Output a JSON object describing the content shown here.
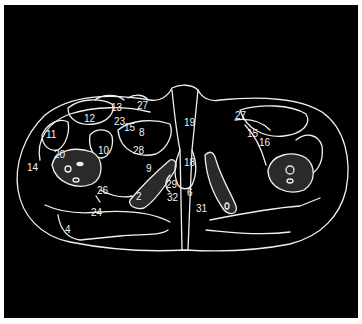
{
  "figure": {
    "type": "axial cross-section line drawing",
    "background": "#000000",
    "line_color": "#f0f0f0",
    "labels": [
      {
        "text": "13",
        "x": 111,
        "y": 103
      },
      {
        "text": "27",
        "x": 137,
        "y": 101
      },
      {
        "text": "12",
        "x": 84,
        "y": 114
      },
      {
        "text": "23",
        "x": 114,
        "y": 117
      },
      {
        "text": "15",
        "x": 124,
        "y": 123
      },
      {
        "text": "8",
        "x": 139,
        "y": 128
      },
      {
        "text": "11",
        "x": 46,
        "y": 130
      },
      {
        "text": "10",
        "x": 98,
        "y": 146
      },
      {
        "text": "28",
        "x": 133,
        "y": 146
      },
      {
        "text": "20",
        "x": 54,
        "y": 150
      },
      {
        "text": "14",
        "x": 27,
        "y": 163
      },
      {
        "text": "9",
        "x": 146,
        "y": 164
      },
      {
        "text": "26",
        "x": 97,
        "y": 186
      },
      {
        "text": "2",
        "x": 136,
        "y": 192
      },
      {
        "text": "24",
        "x": 91,
        "y": 208
      },
      {
        "text": "4",
        "x": 65,
        "y": 225
      },
      {
        "text": "19",
        "x": 184,
        "y": 118
      },
      {
        "text": "18",
        "x": 184,
        "y": 158
      },
      {
        "text": "29",
        "x": 166,
        "y": 180
      },
      {
        "text": "32",
        "x": 167,
        "y": 193
      },
      {
        "text": "6",
        "x": 187,
        "y": 188
      },
      {
        "text": "31",
        "x": 196,
        "y": 204
      },
      {
        "text": "27",
        "x": 235,
        "y": 111
      },
      {
        "text": "15",
        "x": 247,
        "y": 129
      },
      {
        "text": "16",
        "x": 259,
        "y": 138
      }
    ]
  }
}
